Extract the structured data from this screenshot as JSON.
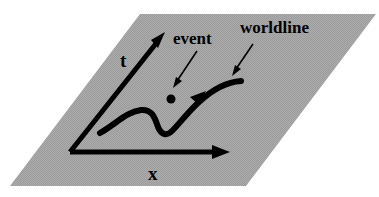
{
  "diagram": {
    "type": "spacetime-diagram",
    "colors": {
      "plane_fill": "#a8a8a8",
      "ink": "#000000",
      "background": "#ffffff"
    },
    "axes": {
      "time_axis_label": "t",
      "space_axis_label": "x"
    },
    "annotations": {
      "event_label": "event",
      "worldline_label": "worldline"
    },
    "elements": {
      "plane_name": "spacetime-plane",
      "event_point_name": "event-point",
      "worldline_name": "worldline-curve"
    }
  }
}
